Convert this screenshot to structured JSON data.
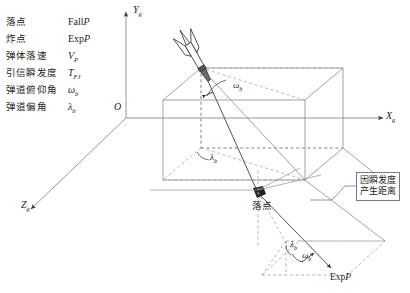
{
  "figure": {
    "title_cjk": "弹道落点与炸点空间关系示意图",
    "background": "#ffffff",
    "solid_line_color": "#8c8c8c",
    "dashed_line_color": "#9a9a9a",
    "ray_line_color": "#4a4a4a",
    "text_color": "#1c1c1c"
  },
  "legend": {
    "rows": [
      {
        "term": "落点",
        "symbol_main": "Fall",
        "symbol_italic": "P",
        "symbol_sub": ""
      },
      {
        "term": "炸点",
        "symbol_main": "Exp",
        "symbol_italic": "P",
        "symbol_sub": ""
      },
      {
        "term": "弹体落速",
        "symbol_main": "",
        "symbol_italic": "V",
        "symbol_sub": "P"
      },
      {
        "term": "引信瞬发度",
        "symbol_main": "",
        "symbol_italic": "T",
        "symbol_sub": "FJ"
      },
      {
        "term": "弹道俯仰角",
        "symbol_main": "",
        "symbol_italic": "ω",
        "symbol_sub": "b"
      },
      {
        "term": "弹道偏角",
        "symbol_main": "",
        "symbol_italic": "λ",
        "symbol_sub": "b"
      }
    ]
  },
  "axes": {
    "origin_label": "O",
    "x_label": "X",
    "x_sub": "g",
    "y_label": "Y",
    "y_sub": "g",
    "z_label": "Z",
    "z_sub": "g"
  },
  "annotations": {
    "fall_point_label": "落点",
    "exp_point_main": "Exp",
    "exp_point_italic": "P",
    "pitch_angle_upper": "ω",
    "pitch_angle_upper_sub": "b",
    "yaw_angle_mid": "λ",
    "yaw_angle_mid_sub": "b",
    "yaw_angle_lower": "λ",
    "yaw_angle_lower_sub": "b",
    "pitch_angle_lower": "ω",
    "pitch_angle_lower_sub": "b",
    "callout_line1": "因瞬发度",
    "callout_line2": "产生距离"
  }
}
